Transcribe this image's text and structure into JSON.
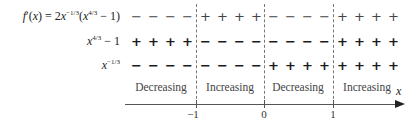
{
  "rows": [
    {
      "label_html": "f′(x) = 2x<sup>−1/3</sup>(x<sup>4/3</sup> − 1)",
      "signs": [
        "−",
        "+",
        "−",
        "+"
      ]
    },
    {
      "label_html": "x<sup>4/3</sup> − 1",
      "signs": [
        "+",
        "−",
        "−",
        "+"
      ]
    },
    {
      "label_html": "x<sup>−1/3</sup>",
      "signs": [
        "−",
        "−",
        "+",
        "+"
      ]
    }
  ],
  "intervals": [
    "Decreasing",
    "Increasing",
    "Decreasing",
    "Increasing"
  ],
  "axis": {
    "ticks": [
      "−1",
      "0",
      "1"
    ],
    "variable": "x"
  }
}
